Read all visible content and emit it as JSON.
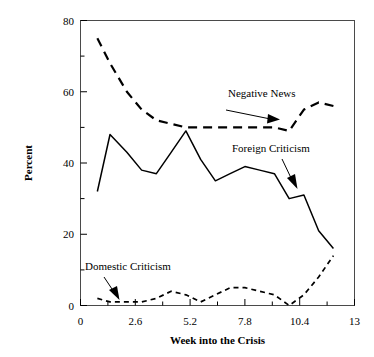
{
  "chart_data": {
    "type": "line",
    "title": "",
    "xlabel": "Week into the Crisis",
    "ylabel": "Percent",
    "xlim": [
      0,
      13
    ],
    "ylim": [
      0,
      80
    ],
    "xticks": [
      "0",
      "2.6",
      "5.2",
      "7.8",
      "10.4",
      "13"
    ],
    "xtick_values": [
      0,
      2.6,
      5.2,
      7.8,
      10.4,
      13
    ],
    "yticks": [
      "0",
      "20",
      "40",
      "60",
      "80"
    ],
    "ytick_values": [
      0,
      20,
      40,
      60,
      80
    ],
    "y_minor_ticks": [
      10,
      30,
      50,
      70
    ],
    "x_minor_ticks": [
      1.3,
      3.9,
      6.5,
      9.1,
      11.7
    ],
    "grid": false,
    "legend_position": "inline-annotations",
    "x": [
      0.8,
      1.4,
      2.2,
      2.9,
      3.6,
      4.3,
      5.0,
      5.7,
      6.4,
      7.1,
      7.8,
      8.5,
      9.2,
      9.9,
      10.6,
      11.3,
      12.0
    ],
    "series": [
      {
        "name": "Negative News",
        "style": "long-dashed",
        "color": "#000000",
        "values": [
          75,
          68,
          60,
          55,
          52,
          51,
          50,
          50,
          50,
          50,
          50,
          50,
          50,
          49,
          55,
          57,
          56
        ]
      },
      {
        "name": "Foreign Criticism",
        "style": "solid",
        "color": "#000000",
        "values": [
          32,
          48,
          43,
          38,
          37,
          43,
          49,
          41,
          35,
          37,
          39,
          38,
          37,
          30,
          31,
          21,
          16
        ]
      },
      {
        "name": "Domestic Criticism",
        "style": "short-dashed",
        "color": "#000000",
        "values": [
          2,
          1,
          1,
          1,
          2,
          4,
          3,
          1,
          3,
          5,
          5,
          4,
          3,
          0,
          3,
          8,
          14
        ]
      }
    ],
    "annotations": [
      {
        "name": "Negative News",
        "label_x": 228,
        "label_y": 97,
        "arrow_from_x": 226,
        "arrow_from_y": 110,
        "arrow_to_x": 274,
        "arrow_to_y": 119
      },
      {
        "name": "Foreign Criticism",
        "label_x": 232,
        "label_y": 152,
        "arrow_from_x": 282,
        "arrow_from_y": 159,
        "arrow_to_x": 296,
        "arrow_to_y": 186
      },
      {
        "name": "Domestic Criticism",
        "label_x": 85,
        "label_y": 270,
        "arrow_from_x": 104,
        "arrow_from_y": 279,
        "arrow_to_x": 118,
        "arrow_to_y": 298
      }
    ]
  }
}
